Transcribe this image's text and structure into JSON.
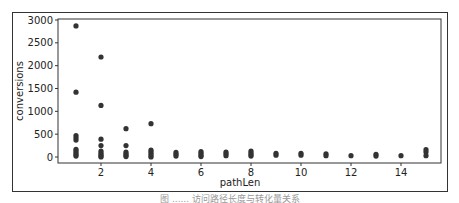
{
  "chart_data": {
    "type": "scatter",
    "title": "",
    "xlabel": "pathLen",
    "ylabel": "conversions",
    "xlim": [
      0.3,
      15.6
    ],
    "ylim": [
      -150,
      3000
    ],
    "xticks": [
      2,
      4,
      6,
      8,
      10,
      12,
      14
    ],
    "yticks": [
      0,
      500,
      1000,
      1500,
      2000,
      2500,
      3000
    ],
    "grid": false,
    "legend": null,
    "marker_color": "#333333",
    "points": [
      [
        1,
        2870
      ],
      [
        1,
        1420
      ],
      [
        1,
        470
      ],
      [
        1,
        420
      ],
      [
        1,
        370
      ],
      [
        1,
        170
      ],
      [
        1,
        130
      ],
      [
        1,
        90
      ],
      [
        1,
        50
      ],
      [
        1,
        20
      ],
      [
        2,
        2190
      ],
      [
        2,
        1130
      ],
      [
        2,
        390
      ],
      [
        2,
        250
      ],
      [
        2,
        130
      ],
      [
        2,
        90
      ],
      [
        2,
        50
      ],
      [
        2,
        20
      ],
      [
        2,
        0
      ],
      [
        3,
        620
      ],
      [
        3,
        250
      ],
      [
        3,
        110
      ],
      [
        3,
        70
      ],
      [
        3,
        40
      ],
      [
        3,
        10
      ],
      [
        4,
        730
      ],
      [
        4,
        150
      ],
      [
        4,
        110
      ],
      [
        4,
        70
      ],
      [
        4,
        30
      ],
      [
        4,
        0
      ],
      [
        5,
        100
      ],
      [
        5,
        60
      ],
      [
        5,
        20
      ],
      [
        6,
        120
      ],
      [
        6,
        80
      ],
      [
        6,
        40
      ],
      [
        6,
        10
      ],
      [
        7,
        110
      ],
      [
        7,
        70
      ],
      [
        7,
        30
      ],
      [
        8,
        130
      ],
      [
        8,
        90
      ],
      [
        8,
        50
      ],
      [
        8,
        20
      ],
      [
        9,
        80
      ],
      [
        9,
        40
      ],
      [
        10,
        80
      ],
      [
        10,
        40
      ],
      [
        11,
        70
      ],
      [
        11,
        30
      ],
      [
        12,
        30
      ],
      [
        13,
        60
      ],
      [
        13,
        20
      ],
      [
        14,
        30
      ],
      [
        15,
        160
      ],
      [
        15,
        110
      ],
      [
        15,
        30
      ]
    ]
  },
  "axes": {
    "xlabel": "pathLen",
    "ylabel": "conversions",
    "xtick_labels": [
      "2",
      "4",
      "6",
      "8",
      "10",
      "12",
      "14"
    ],
    "ytick_labels": [
      "0",
      "500",
      "1000",
      "1500",
      "2000",
      "2500",
      "3000"
    ]
  },
  "caption": "图 ...... 访问路径长度与转化量关系"
}
